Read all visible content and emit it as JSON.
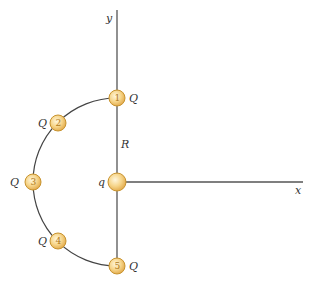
{
  "figure": {
    "axes": {
      "x_label": "x",
      "y_label": "y"
    },
    "center_charge": {
      "label": "q"
    },
    "radius_label": "R",
    "charges": [
      {
        "number": "1",
        "label": "Q"
      },
      {
        "number": "2",
        "label": "Q"
      },
      {
        "number": "3",
        "label": "Q"
      },
      {
        "number": "4",
        "label": "Q"
      },
      {
        "number": "5",
        "label": "Q"
      }
    ],
    "colors": {
      "ball_fill": "#f6d58a",
      "ball_stroke": "#c8932e",
      "axis": "#555555",
      "arc": "#444444"
    }
  }
}
